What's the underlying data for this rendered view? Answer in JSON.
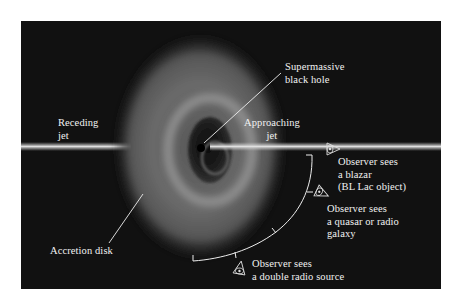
{
  "figure": {
    "background_color": "#111111",
    "labels": {
      "black_hole": {
        "line1": "Supermassive",
        "line2": "black hole"
      },
      "receding_jet": {
        "line1": "Receding",
        "line2": "jet"
      },
      "approaching_jet": {
        "line1": "Approaching",
        "line2": "jet"
      },
      "accretion_disk": {
        "line1": "Accretion disk"
      },
      "observer_blazar": {
        "line1": "Observer sees",
        "line2": "a blazar",
        "line3": "(BL Lac object)"
      },
      "observer_quasar": {
        "line1": "Observer sees",
        "line2": "a quasar or radio",
        "line3": "galaxy"
      },
      "observer_double": {
        "line1": "Observer sees",
        "line2": "a double radio source"
      }
    },
    "icons": [
      "eye-icon-blazar",
      "eye-icon-quasar",
      "eye-icon-double-radio"
    ]
  }
}
